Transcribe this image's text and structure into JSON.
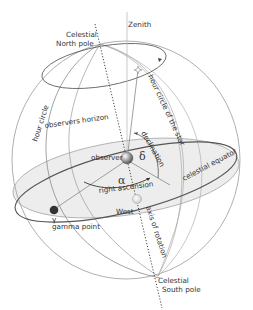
{
  "diagram": {
    "type": "celestial-sphere",
    "labels": {
      "zenith": "Zenith",
      "north_pole_1": "Celestial",
      "north_pole_2": "North pole",
      "south_pole_1": "Celestial",
      "south_pole_2": "South pole",
      "hour_circle_star": "hour circle of the star",
      "hour_circle": "hour circle",
      "observers_horizon": "observers horizon",
      "declination": "declination",
      "delta": "δ",
      "observer": "observer",
      "alpha": "α",
      "right_ascension": "right ascension",
      "celestial_equator": "celestial equator",
      "west": "West",
      "axis_of_rotation": "axis of rotation",
      "gamma": "γ",
      "gamma_point": "gamma point"
    },
    "colors": {
      "sphere_line": "#9a9a9a",
      "dark_line": "#555555",
      "horizon_fill": "#ececec",
      "gamma_point": "#333333",
      "text": "#333333"
    }
  }
}
